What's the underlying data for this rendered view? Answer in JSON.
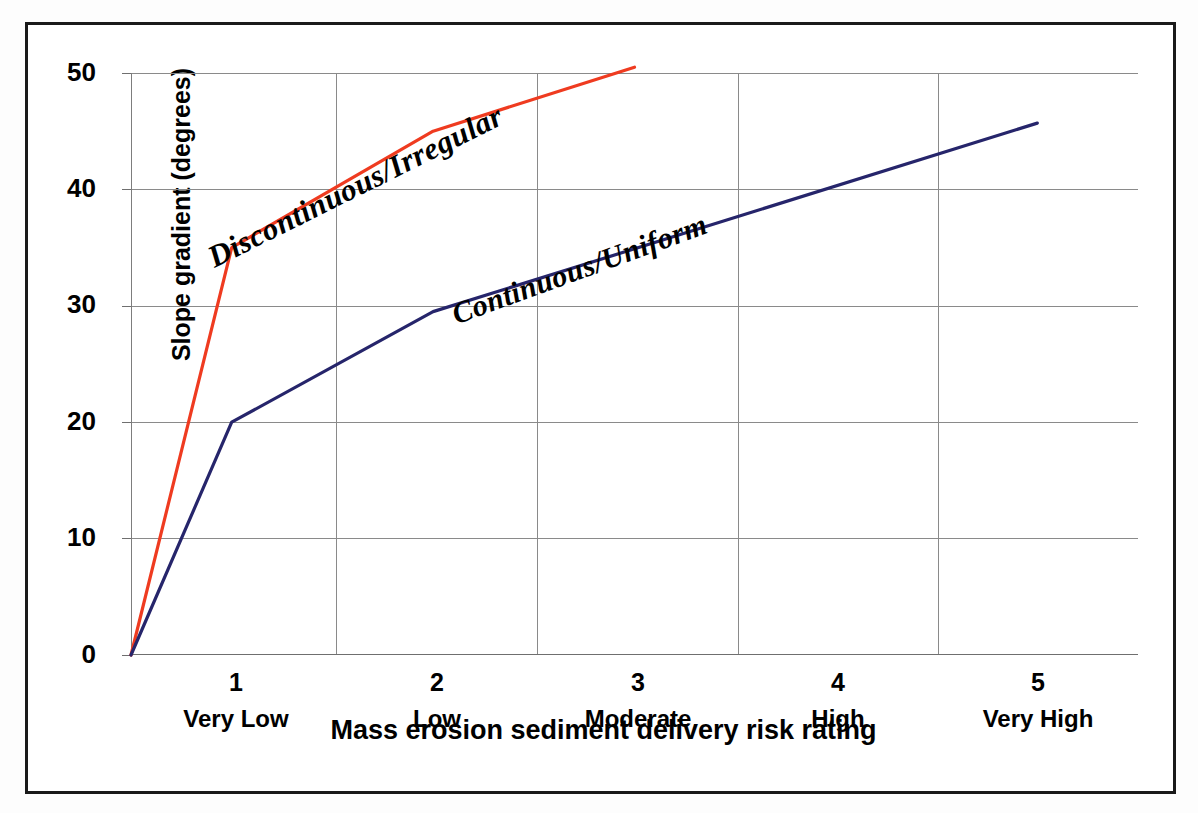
{
  "figure": {
    "background_color": "#ffffff",
    "frame_color": "#1a1a1a"
  },
  "chart_data": {
    "type": "line",
    "title": "",
    "xlabel": "Mass erosion sediment delivery risk rating",
    "ylabel": "Slope gradient (degrees)",
    "categories": [
      "Very Low",
      "Low",
      "Moderate",
      "High",
      "Very High"
    ],
    "category_numbers": [
      "1",
      "2",
      "3",
      "4",
      "5"
    ],
    "x": [
      1,
      2,
      3,
      4,
      5
    ],
    "xlim": [
      0.5,
      5.5
    ],
    "ylim": [
      0,
      50
    ],
    "yticks": [
      0,
      10,
      20,
      30,
      40,
      50
    ],
    "ytick_labels": [
      "0",
      "10",
      "20",
      "30",
      "40",
      "50"
    ],
    "grid": "both",
    "legend_position": "inline-annotations",
    "series": [
      {
        "name": "Discontinuous/Irregular",
        "color": "#ef3b20",
        "x": [
          0.5,
          1,
          2,
          3
        ],
        "values": [
          0,
          35,
          45,
          50.5
        ],
        "annotation": "Discontinuous/Irregular"
      },
      {
        "name": "Continuous/Uniform",
        "color": "#26256b",
        "x": [
          0.5,
          1,
          2,
          5
        ],
        "values": [
          0,
          20,
          29.5,
          45.7
        ],
        "annotation": "Continuous/Uniform"
      }
    ]
  },
  "axes": {
    "y_title": "Slope gradient (degrees)",
    "x_title": "Mass erosion sediment delivery risk rating",
    "y_labels": [
      "50",
      "40",
      "30",
      "20",
      "10",
      "0"
    ],
    "x_number_labels": [
      "1",
      "2",
      "3",
      "4",
      "5"
    ],
    "x_name_labels": [
      "Very Low",
      "Low",
      "Moderate",
      "High",
      "Very High"
    ]
  },
  "annotations": {
    "discontinuous": "Discontinuous/Irregular",
    "continuous": "Continuous/Uniform"
  },
  "colors": {
    "series_discontinuous": "#ef3b20",
    "series_continuous": "#26256b",
    "gridline": "#8a8a8a",
    "text": "#000000"
  }
}
